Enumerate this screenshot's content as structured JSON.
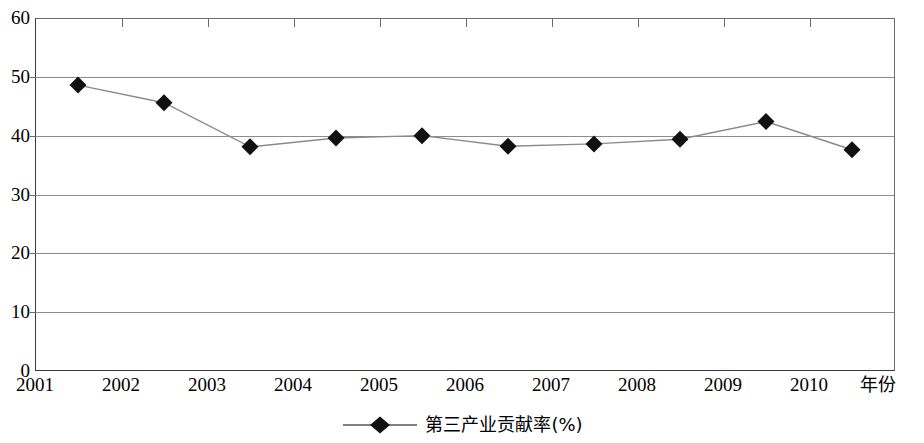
{
  "chart_data": {
    "type": "line",
    "title": "",
    "subtitle": "",
    "xlabel": "年份",
    "ylabel": "",
    "xlim": [
      2001,
      2011
    ],
    "ylim": [
      0,
      60
    ],
    "grid": true,
    "legend_position": "bottom",
    "x_tick_labels": [
      "2001",
      "2002",
      "2003",
      "2004",
      "2005",
      "2006",
      "2007",
      "2008",
      "2009",
      "2010"
    ],
    "y_tick_labels": [
      "0",
      "10",
      "20",
      "30",
      "40",
      "50",
      "60"
    ],
    "y_ticks": [
      0,
      10,
      20,
      30,
      40,
      50,
      60
    ],
    "series": [
      {
        "name": "第三产业贡献率(%)",
        "marker": "diamond",
        "marker_color": "#111111",
        "line_color": "#8a8a8a",
        "x": [
          2001.5,
          2002.5,
          2003.5,
          2004.5,
          2005.5,
          2006.5,
          2007.5,
          2008.5,
          2009.5,
          2010.5
        ],
        "values": [
          48.6,
          45.6,
          38.1,
          39.6,
          40.0,
          38.2,
          38.6,
          39.4,
          42.4,
          37.6
        ]
      }
    ]
  },
  "legend": {
    "entries": [
      {
        "label": "第三产业贡献率(%)"
      }
    ]
  },
  "axis": {
    "x_title": "年份"
  }
}
